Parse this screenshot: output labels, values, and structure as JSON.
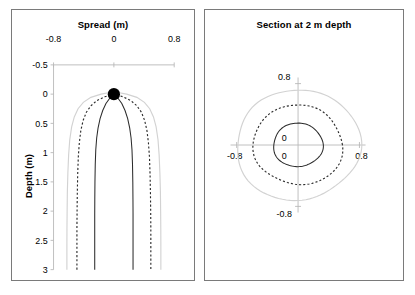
{
  "figure": {
    "background": "#ffffff",
    "panel_border_color": "#7a7a7a"
  },
  "left_panel": {
    "title": "Spread (m)",
    "y_axis_title": "Depth (m)",
    "x_ticks": [
      "-0.8",
      "0",
      "0.8"
    ],
    "y_ticks": [
      "-0.5",
      "0",
      "0.5",
      "1",
      "1.5",
      "2",
      "2.5",
      "3"
    ]
  },
  "right_panel": {
    "title": "Section at 2 m depth",
    "label_top": "0.8",
    "label_bottom": "-0.8",
    "label_left": "-0.8",
    "label_right": "0.8",
    "label_origin_y": "0",
    "label_origin_x": "0"
  },
  "chart_data": [
    {
      "type": "line",
      "title": "Spread (m)",
      "xlabel": "Spread (m)",
      "ylabel": "Depth (m)",
      "xlim": [
        -0.95,
        0.95
      ],
      "ylim": [
        -0.5,
        3.0
      ],
      "y_inverted": true,
      "grid": false,
      "legend": "none",
      "xticks": [
        -0.8,
        0,
        0.8
      ],
      "yticks": [
        -0.5,
        0,
        0.5,
        1,
        1.5,
        2,
        2.5,
        3
      ],
      "annotations": [
        {
          "name": "source-point",
          "x": 0,
          "y": 0,
          "marker": "filled-circle",
          "color": "#000000"
        }
      ],
      "series": [
        {
          "name": "inner-plume-solid",
          "style": "solid",
          "color": "#2b2b2b",
          "description": "narrow wetting front, right branch (mirrored on left)",
          "x_right": [
            0.0,
            0.055,
            0.105,
            0.148,
            0.183,
            0.21,
            0.228,
            0.24,
            0.247,
            0.251,
            0.253,
            0.254,
            0.254,
            0.254,
            0.254,
            0.254
          ],
          "y": [
            0.0,
            0.07,
            0.16,
            0.28,
            0.42,
            0.58,
            0.75,
            0.95,
            1.2,
            1.5,
            1.8,
            2.05,
            2.3,
            2.55,
            2.8,
            3.0
          ]
        },
        {
          "name": "mid-plume-dashed",
          "style": "dashed",
          "color": "#2b2b2b",
          "description": "intermediate wetting front, right branch (mirrored on left)",
          "x_right": [
            0.0,
            0.12,
            0.225,
            0.305,
            0.365,
            0.408,
            0.438,
            0.458,
            0.472,
            0.48,
            0.485,
            0.488,
            0.49,
            0.49,
            0.49,
            0.49
          ],
          "y": [
            0.0,
            0.045,
            0.11,
            0.2,
            0.31,
            0.45,
            0.62,
            0.83,
            1.08,
            1.38,
            1.7,
            2.0,
            2.3,
            2.6,
            2.85,
            3.0
          ]
        },
        {
          "name": "outer-plume-gray",
          "style": "solid",
          "color": "#d2d2d2",
          "description": "outer wetting front, right branch (mirrored on left)",
          "x_right": [
            0.0,
            0.17,
            0.305,
            0.405,
            0.475,
            0.525,
            0.56,
            0.585,
            0.6,
            0.61,
            0.617,
            0.62,
            0.622,
            0.623,
            0.623,
            0.623
          ],
          "y": [
            -0.04,
            0.0,
            0.055,
            0.14,
            0.25,
            0.39,
            0.56,
            0.78,
            1.04,
            1.35,
            1.68,
            2.0,
            2.3,
            2.6,
            2.85,
            3.0
          ]
        }
      ]
    },
    {
      "type": "line",
      "title": "Section at 2 m depth",
      "xlabel": "",
      "ylabel": "",
      "xlim": [
        -0.95,
        0.95
      ],
      "ylim": [
        -0.95,
        0.95
      ],
      "grid": false,
      "legend": "none",
      "xticks": [
        -0.8,
        0,
        0.8
      ],
      "yticks": [
        -0.8,
        0,
        0.8
      ],
      "series": [
        {
          "name": "inner-contour-solid",
          "style": "solid",
          "color": "#2b2b2b",
          "shape": "closed-contour",
          "radius": 0.3
        },
        {
          "name": "mid-contour-dashed",
          "style": "dashed",
          "color": "#2b2b2b",
          "shape": "closed-contour",
          "radius": 0.545
        },
        {
          "name": "outer-contour-gray",
          "style": "solid",
          "color": "#d2d2d2",
          "shape": "closed-contour",
          "radius": 0.755
        }
      ]
    }
  ]
}
